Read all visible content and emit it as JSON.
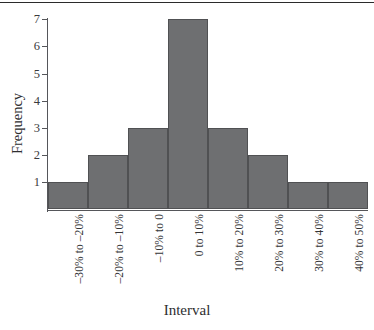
{
  "chart_data": {
    "type": "bar",
    "title": "",
    "xlabel": "Interval",
    "ylabel": "Frequency",
    "categories": [
      "–30% to –20%",
      "–20% to –10%",
      "–10% to 0",
      "0 to 10%",
      "10% to 20%",
      "20% to 30%",
      "30% to 40%",
      "40% to 50%"
    ],
    "values": [
      1,
      2,
      3,
      7,
      3,
      2,
      1,
      1
    ],
    "ylim": [
      0,
      7
    ],
    "yticks": [
      1,
      2,
      3,
      4,
      5,
      6,
      7
    ],
    "ytick_labels": [
      "1",
      "2",
      "3",
      "4",
      "5",
      "6",
      "7"
    ],
    "grid": false,
    "legend": null,
    "bar_color": "#6e6f71",
    "bar_edge_color": "#505153",
    "axis_color": "#55565a",
    "text_color": "#2e2e30",
    "background": "#ffffff"
  }
}
